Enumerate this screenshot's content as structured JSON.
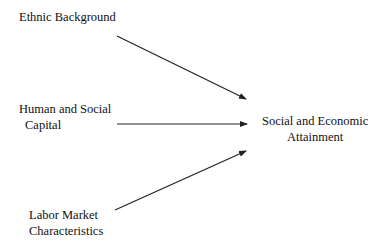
{
  "diagram": {
    "nodes": [
      {
        "id": "ethnic",
        "lines": [
          "Ethnic Background"
        ]
      },
      {
        "id": "human",
        "lines": [
          "Human and Social",
          "Capital"
        ]
      },
      {
        "id": "labor",
        "lines": [
          "Labor Market",
          "Characteristics"
        ]
      },
      {
        "id": "outcome",
        "lines": [
          "Social and Economic",
          "Attainment"
        ]
      }
    ],
    "edges": [
      {
        "from": "ethnic",
        "to": "outcome"
      },
      {
        "from": "human",
        "to": "outcome"
      },
      {
        "from": "labor",
        "to": "outcome"
      }
    ],
    "colors": {
      "line": "#222222",
      "text": "#111111",
      "background": "#ffffff"
    }
  }
}
